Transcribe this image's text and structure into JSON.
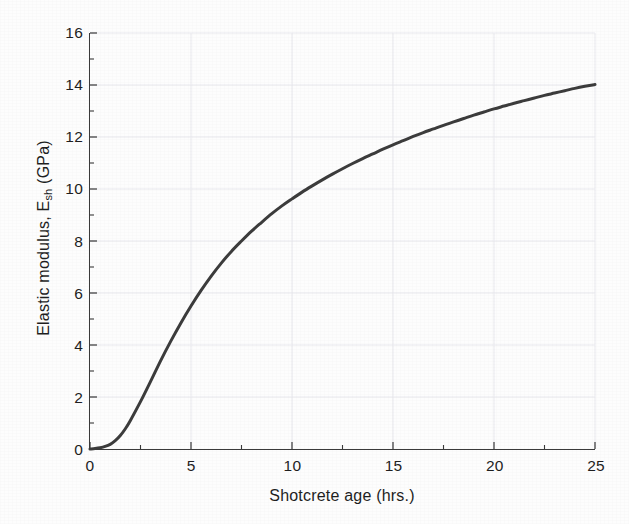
{
  "chart_data": {
    "type": "line",
    "title": "",
    "xlabel": "Shotcrete age (hrs.)",
    "ylabel_text": "Elastic modulus, E",
    "ylabel_sub": "sh",
    "ylabel_unit": " (GPa)",
    "ylabel_full": "Elastic modulus, Esh (GPa)",
    "xlim": [
      0,
      25
    ],
    "ylim": [
      0,
      16
    ],
    "xticks": [
      0,
      5,
      10,
      15,
      20,
      25
    ],
    "yticks": [
      0,
      2,
      4,
      6,
      8,
      10,
      12,
      14,
      16
    ],
    "xtick_labels": [
      "0",
      "5",
      "10",
      "15",
      "20",
      "25"
    ],
    "ytick_labels": [
      "0",
      "2",
      "4",
      "6",
      "8",
      "10",
      "12",
      "14",
      "16"
    ],
    "x_minor_step": 2.5,
    "y_minor_step": 1,
    "grid": true,
    "grid_color": "#e9e9ee",
    "legend": null,
    "line_color": "#3c3c3c",
    "line_width": 3.0,
    "background_color": "#fdfdfd",
    "axis_color": "#3a3a3a",
    "tick_direction": "in",
    "series": [
      {
        "name": "Elastic modulus development",
        "x": [
          0,
          0.25,
          0.5,
          0.75,
          1,
          1.25,
          1.5,
          1.75,
          2,
          2.5,
          3,
          3.5,
          4,
          4.5,
          5,
          5.5,
          6,
          6.5,
          7,
          7.5,
          8,
          8.5,
          9,
          9.5,
          10,
          10.5,
          11,
          11.5,
          12,
          12.5,
          13,
          13.5,
          14,
          14.5,
          15,
          15.5,
          16,
          16.5,
          17,
          17.5,
          18,
          18.5,
          19,
          19.5,
          20,
          20.5,
          21,
          21.5,
          22,
          22.5,
          23,
          23.5,
          24,
          24.5,
          25
        ],
        "y": [
          0.0,
          0.02,
          0.05,
          0.1,
          0.18,
          0.32,
          0.52,
          0.78,
          1.1,
          1.82,
          2.6,
          3.4,
          4.15,
          4.85,
          5.5,
          6.1,
          6.65,
          7.15,
          7.6,
          8.0,
          8.38,
          8.72,
          9.05,
          9.35,
          9.62,
          9.88,
          10.12,
          10.35,
          10.57,
          10.78,
          10.98,
          11.17,
          11.35,
          11.53,
          11.7,
          11.86,
          12.02,
          12.17,
          12.31,
          12.45,
          12.58,
          12.71,
          12.84,
          12.96,
          13.08,
          13.19,
          13.3,
          13.4,
          13.5,
          13.6,
          13.69,
          13.78,
          13.87,
          13.95,
          14.02
        ]
      }
    ],
    "annotations": []
  },
  "figure": {
    "alt": "Line chart of elastic modulus of shotcrete versus age in hours"
  }
}
